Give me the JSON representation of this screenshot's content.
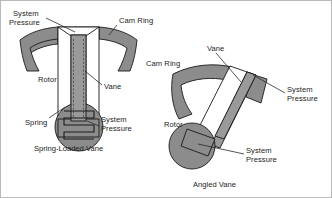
{
  "figure": {
    "colors": {
      "cam_ring_fill": "#8c8c8c",
      "vane_fill": "#9a9a9a",
      "rotor_fill": "#8c8c8c",
      "slot_fill": "#ffffff",
      "outline": "#1a1a1a",
      "text": "#1d1d1d",
      "background": "#ffffff"
    }
  },
  "left_diagram": {
    "caption": "Spring-Loaded Vane",
    "labels": {
      "system_pressure_top_line1": "System",
      "system_pressure_top_line2": "Pressure",
      "cam_ring": "Cam Ring",
      "rotor": "Rotor",
      "vane": "Vane",
      "spring": "Spring",
      "system_pressure_bottom_line1": "System",
      "system_pressure_bottom_line2": "Pressure"
    }
  },
  "right_diagram": {
    "caption": "Angled Vane",
    "labels": {
      "cam_ring": "Cam Ring",
      "vane": "Vane",
      "system_pressure_upper_line1": "System",
      "system_pressure_upper_line2": "Pressure",
      "rotor": "Rotor",
      "system_pressure_lower_line1": "System",
      "system_pressure_lower_line2": "Pressure"
    }
  }
}
